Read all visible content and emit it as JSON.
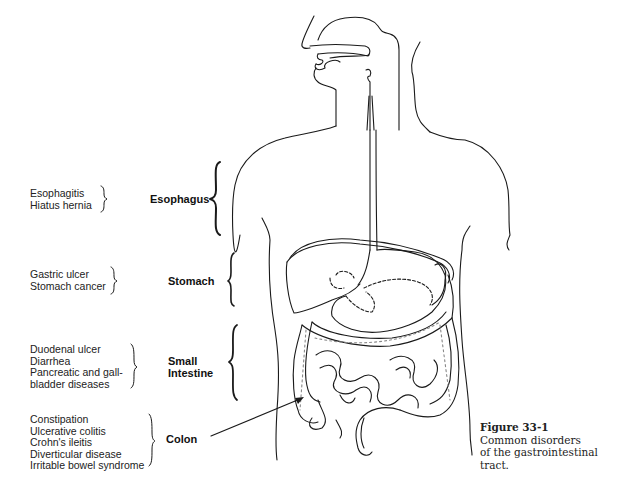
{
  "figure": {
    "title": "Figure 33-1",
    "caption_lines": [
      "Common disorders",
      "of the gastrointestinal",
      "tract."
    ]
  },
  "regions": [
    {
      "organ_lines": [
        "Esophagus"
      ],
      "disorders": [
        "Esophagitis",
        "Hiatus hernia"
      ]
    },
    {
      "organ_lines": [
        "Stomach"
      ],
      "disorders": [
        "Gastric ulcer",
        "Stomach cancer"
      ]
    },
    {
      "organ_lines": [
        "Small",
        "Intestine"
      ],
      "disorders": [
        "Duodenal ulcer",
        "Diarrhea",
        "Pancreatic and gall-",
        "bladder diseases"
      ]
    },
    {
      "organ_lines": [
        "Colon"
      ],
      "disorders": [
        "Constipation",
        "Ulcerative colitis",
        "Crohn's ileitis",
        "Diverticular disease",
        "Irritable bowel syndrome"
      ]
    }
  ],
  "colors": {
    "line": "#1a1a1a",
    "background": "#ffffff"
  }
}
